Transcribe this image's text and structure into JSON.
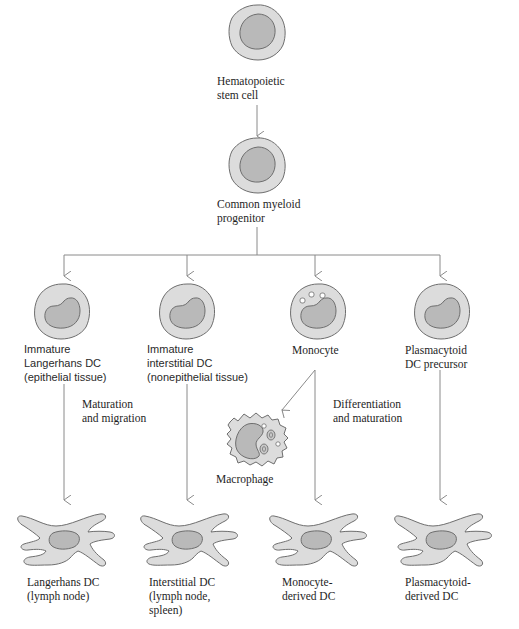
{
  "diagram": {
    "type": "cell-lineage-flowchart",
    "colors": {
      "cytoplasm": "#dcdcdc",
      "nucleus": "#b9b9b9",
      "outline": "#6e6e6e",
      "arrow": "#8a8a8a",
      "text": "#1e1e1e"
    },
    "nodes": {
      "hsc": {
        "label_lines": [
          "Hematopoietic",
          "stem cell"
        ],
        "shape": "round-cell"
      },
      "cmp": {
        "label_lines": [
          "Common myeloid",
          "progenitor"
        ],
        "shape": "round-cell"
      },
      "imm_langerhans": {
        "label_lines": [
          "Immature",
          "Langerhans DC",
          "(epithelial tissue)"
        ],
        "shape": "kidney-nucleus-cell"
      },
      "imm_interstitial": {
        "label_lines": [
          "Immature",
          "interstitial DC",
          "(nonepithelial tissue)"
        ],
        "shape": "kidney-nucleus-cell"
      },
      "monocyte": {
        "label_lines": [
          "Monocyte"
        ],
        "shape": "granular-kidney-cell"
      },
      "plasmacytoid_precursor": {
        "label_lines": [
          "Plasmacytoid",
          "DC precursor"
        ],
        "shape": "kidney-nucleus-cell"
      },
      "macrophage": {
        "label_lines": [
          "Macrophage"
        ],
        "shape": "ruffled-cell"
      },
      "langerhans_dc": {
        "label_lines": [
          "Langerhans DC",
          "(lymph node)"
        ],
        "shape": "dendritic-cell"
      },
      "interstitial_dc": {
        "label_lines": [
          "Interstitial DC",
          "(lymph node,",
          "spleen)"
        ],
        "shape": "dendritic-cell"
      },
      "monocyte_dc": {
        "label_lines": [
          "Monocyte-",
          "derived DC"
        ],
        "shape": "dendritic-cell"
      },
      "plasmacytoid_dc": {
        "label_lines": [
          "Plasmacytoid-",
          "derived DC"
        ],
        "shape": "dendritic-cell"
      }
    },
    "edge_labels": {
      "maturation_migration": [
        "Maturation",
        "and migration"
      ],
      "differentiation_maturation": [
        "Differentiation",
        "and maturation"
      ]
    },
    "edges": [
      {
        "from": "hsc",
        "to": "cmp"
      },
      {
        "from": "cmp",
        "to": "imm_langerhans"
      },
      {
        "from": "cmp",
        "to": "imm_interstitial"
      },
      {
        "from": "cmp",
        "to": "monocyte"
      },
      {
        "from": "cmp",
        "to": "plasmacytoid_precursor"
      },
      {
        "from": "imm_langerhans",
        "to": "langerhans_dc"
      },
      {
        "from": "imm_interstitial",
        "to": "interstitial_dc"
      },
      {
        "from": "monocyte",
        "to": "macrophage"
      },
      {
        "from": "monocyte",
        "to": "monocyte_dc"
      },
      {
        "from": "plasmacytoid_precursor",
        "to": "plasmacytoid_dc"
      }
    ]
  }
}
